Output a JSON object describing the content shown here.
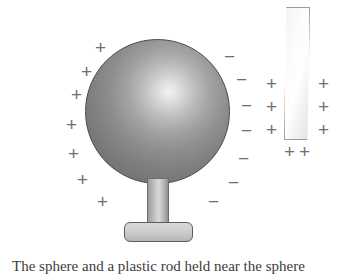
{
  "figure": {
    "background_color": "#ffffff",
    "width": 357,
    "height": 276
  },
  "sphere": {
    "name": "charged conducting sphere",
    "fill_light": "#f2f2f2",
    "fill_dark": "#666666",
    "outline_color": "#4a4a4a",
    "center_x": 157,
    "center_y": 111,
    "diameter": 145
  },
  "stand": {
    "post_label": "insulating post",
    "base_label": "base",
    "fill": "#cfcfcf",
    "outline_color": "#5e5e5e"
  },
  "strip": {
    "name": "charged strip",
    "fill": "#fbfbfb",
    "outline_color": "#9b9b9b",
    "left": 284,
    "top": 7,
    "width": 26,
    "height": 133
  },
  "charges": {
    "positive_symbol": "+",
    "negative_symbol": "−",
    "color": "#6f6f6f",
    "sphere_left_positive": [
      {
        "symbol": "+",
        "x": 95,
        "y": 38
      },
      {
        "symbol": "+",
        "x": 81,
        "y": 62
      },
      {
        "symbol": "+",
        "x": 71,
        "y": 85
      },
      {
        "symbol": "+",
        "x": 66,
        "y": 115
      },
      {
        "symbol": "+",
        "x": 68,
        "y": 144
      },
      {
        "symbol": "+",
        "x": 77,
        "y": 170
      },
      {
        "symbol": "+",
        "x": 97,
        "y": 192
      }
    ],
    "sphere_right_negative": [
      {
        "symbol": "−",
        "x": 224,
        "y": 47
      },
      {
        "symbol": "−",
        "x": 236,
        "y": 70
      },
      {
        "symbol": "−",
        "x": 241,
        "y": 96
      },
      {
        "symbol": "−",
        "x": 241,
        "y": 121
      },
      {
        "symbol": "−",
        "x": 238,
        "y": 149
      },
      {
        "symbol": "−",
        "x": 228,
        "y": 173
      },
      {
        "symbol": "−",
        "x": 208,
        "y": 192
      }
    ],
    "strip_left_positive": [
      {
        "symbol": "+",
        "x": 266,
        "y": 74
      },
      {
        "symbol": "+",
        "x": 266,
        "y": 97
      },
      {
        "symbol": "+",
        "x": 266,
        "y": 120
      }
    ],
    "strip_right_positive": [
      {
        "symbol": "+",
        "x": 318,
        "y": 74
      },
      {
        "symbol": "+",
        "x": 318,
        "y": 97
      },
      {
        "symbol": "+",
        "x": 318,
        "y": 120
      }
    ],
    "strip_bottom_positive": [
      {
        "symbol": "+",
        "x": 284,
        "y": 142
      },
      {
        "symbol": "+",
        "x": 299,
        "y": 142
      }
    ]
  },
  "caption": {
    "text": "The sphere and a plastic rod held near the sphere",
    "clipped": true
  }
}
